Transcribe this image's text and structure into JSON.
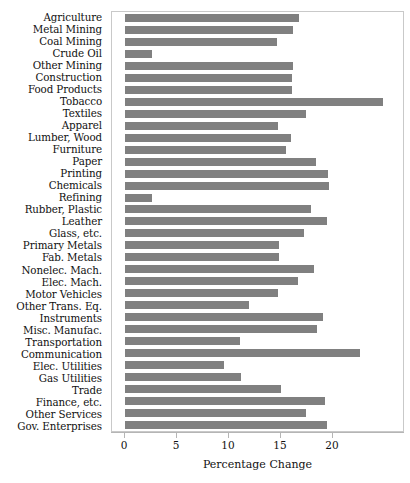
{
  "chart_data": {
    "type": "bar",
    "orientation": "horizontal",
    "title": "",
    "xlabel": "Percentage Change",
    "ylabel": "",
    "xlim": [
      0,
      28.2
    ],
    "xticks": [
      0,
      5,
      10,
      15,
      20
    ],
    "grid": false,
    "legend": null,
    "bar_color": "#808080",
    "frame_color": "#c9c9c9",
    "categories": [
      "Agriculture",
      "Metal Mining",
      "Coal Mining",
      "Crude Oil",
      "Other Mining",
      "Construction",
      "Food Products",
      "Tobacco",
      "Textiles",
      "Apparel",
      "Lumber, Wood",
      "Furniture",
      "Paper",
      "Printing",
      "Chemicals",
      "Refining",
      "Rubber, Plastic",
      "Leather",
      "Glass, etc.",
      "Primary Metals",
      "Fab. Metals",
      "Nonelec. Mach.",
      "Elec. Mach.",
      "Motor Vehicles",
      "Other Trans. Eq.",
      "Instruments",
      "Misc. Manufac.",
      "Transportation",
      "Communication",
      "Elec. Utilities",
      "Gas Utilities",
      "Trade",
      "Finance, etc.",
      "Other Services",
      "Gov. Enterprises"
    ],
    "values": [
      16.7,
      16.2,
      14.6,
      2.6,
      16.2,
      16.1,
      16.1,
      24.8,
      17.4,
      14.7,
      16.0,
      15.5,
      18.4,
      19.5,
      19.6,
      2.6,
      17.9,
      19.4,
      17.2,
      14.8,
      14.8,
      18.2,
      16.6,
      14.7,
      11.9,
      19.0,
      18.5,
      11.1,
      22.6,
      9.5,
      11.2,
      15.0,
      19.2,
      17.4,
      19.4
    ]
  }
}
